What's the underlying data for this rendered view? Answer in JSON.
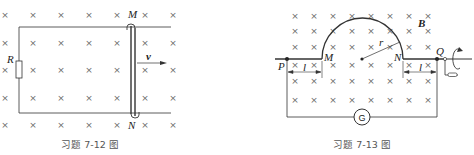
{
  "figure_left": {
    "caption": "习题 7-12 图",
    "labels": {
      "M": "M",
      "N": "N",
      "R": "R",
      "v": "v"
    },
    "field_symbol": "×",
    "field_cols": [
      5,
      33,
      61,
      89,
      117,
      145,
      173
    ],
    "field_rows": [
      15,
      43,
      70,
      98,
      125
    ]
  },
  "figure_right": {
    "caption": "习题 7-13 图",
    "labels": {
      "P": "P",
      "M": "M",
      "N": "N",
      "Q": "Q",
      "B": "B",
      "r": "r",
      "l_left": "l",
      "l_right": "l",
      "G": "G"
    },
    "field_symbol": "×"
  },
  "colors": {
    "line": "#333333",
    "mark": "#6a6a6a",
    "caption": "#555555"
  }
}
